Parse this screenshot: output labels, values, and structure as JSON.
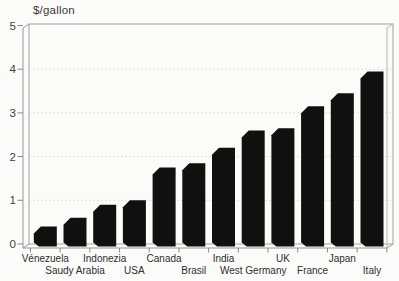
{
  "chart_data": {
    "type": "bar",
    "title": "$/gallon",
    "ylabel": "$/gallon",
    "xlabel": "",
    "categories": [
      "Vénezuela",
      "Saudy Arabia",
      "Indonezia",
      "USA",
      "Canada",
      "Brasil",
      "India",
      "West Germany",
      "UK",
      "France",
      "Japan",
      "Italy"
    ],
    "values": [
      0.4,
      0.6,
      0.9,
      1.0,
      1.75,
      1.85,
      2.2,
      2.6,
      2.65,
      3.15,
      3.45,
      3.95
    ],
    "ylim": [
      0,
      5
    ],
    "yticks": [
      0,
      1,
      2,
      3,
      4,
      5
    ],
    "grid": "horizontal dotted lines at each integer, 3D box frame",
    "legend": "none",
    "bar_color": "#101010",
    "frame_color": "#a2a2a2",
    "grid_color": "#d4d4d4",
    "text_color": "#3a3a3a"
  }
}
